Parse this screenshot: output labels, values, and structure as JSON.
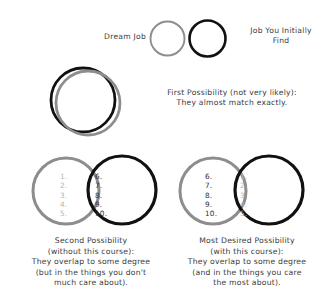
{
  "figure": {
    "title_absent": true,
    "legend": {
      "dream_job_label": "Dream Job",
      "found_job_label": "Job You Initially\nFind",
      "dream_job_color": "#8d8d8d",
      "found_job_color": "#111111"
    },
    "row_first": {
      "caption": "First Possibility (not very likely):\nThey almost match exactly."
    },
    "row_bottom": {
      "left": {
        "caption": "Second Possibility\n(without this course):\nThey overlap to some degree\n(but in the things you don't\nmuch care about).",
        "outer_numbers": "1.\n2.\n3.\n4.\n5.",
        "overlap_numbers": "6.\n7.\n8.\n9.\n10.",
        "outer_numbers_color": "#b4b4b4",
        "overlap_numbers_color": "#2f2f2f"
      },
      "right": {
        "caption": "Most Desired Possibility\n(with this course):\nThey overlap to some degree\n(and in the things you care\nthe most about).",
        "outer_numbers": "6.\n7.\n8.\n9.\n10.",
        "overlap_numbers": "1.\n2.\n3.\n4.\n5.",
        "outer_numbers_color": "#2f2f2f",
        "overlap_numbers_color": "#b4b4b4"
      }
    }
  }
}
